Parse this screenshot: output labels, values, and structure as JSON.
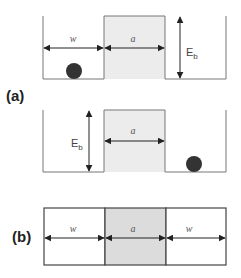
{
  "figure": {
    "colors": {
      "line": "#777777",
      "barrier_fill": "#e8e8e8",
      "barrier_fill_b": "#d9d9d9",
      "ball": "#333333",
      "arrow": "#222222",
      "background": "#ffffff"
    },
    "panel_a": {
      "label": "(a)",
      "top_well": {
        "width_label": "w",
        "barrier_label": "a",
        "energy_label": "E",
        "energy_sub": "b",
        "ball_position": "left"
      },
      "bottom_well": {
        "barrier_label": "a",
        "energy_label": "E",
        "energy_sub": "b",
        "ball_position": "right"
      }
    },
    "panel_b": {
      "label": "(b)",
      "segments": [
        {
          "label": "w",
          "shaded": false
        },
        {
          "label": "a",
          "shaded": true
        },
        {
          "label": "w",
          "shaded": false
        }
      ]
    }
  }
}
